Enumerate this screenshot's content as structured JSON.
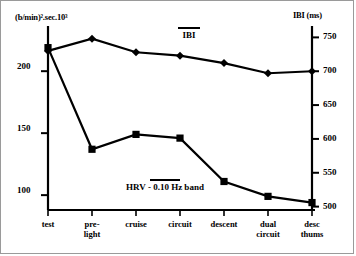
{
  "chart_data": {
    "type": "line",
    "title": "",
    "xlabel": "",
    "categories": [
      "test",
      "pre-light",
      "cruise",
      "circuit",
      "descent",
      "dual circuit",
      "desc thums"
    ],
    "category_lines": [
      [
        "test",
        ""
      ],
      [
        "pre-",
        "light"
      ],
      [
        "cruise",
        ""
      ],
      [
        "circuit",
        ""
      ],
      [
        "descent",
        ""
      ],
      [
        "dual",
        "circuit"
      ],
      [
        "desc",
        "thums"
      ]
    ],
    "grid": false,
    "legend_position": "inline-annotations",
    "axes": {
      "left": {
        "label": "(b/min)².sec.10³",
        "ticks": [
          200,
          150,
          100
        ],
        "tick_labels": [
          "200",
          "150",
          "100"
        ],
        "min": 88,
        "max": 230
      },
      "right": {
        "label": "IBI (ms)",
        "ticks": [
          750,
          700,
          650,
          600,
          550,
          500
        ],
        "tick_labels": [
          "750",
          "700",
          "650",
          "600",
          "550",
          "500"
        ],
        "min": 495,
        "max": 755
      }
    },
    "series": [
      {
        "name": "IBI",
        "annotation": "IBI",
        "axis": "right",
        "marker": "diamond",
        "unit": "ms",
        "values": [
          730,
          748,
          728,
          723,
          712,
          697,
          700
        ]
      },
      {
        "name": "HRV - 0.10 Hz band",
        "annotation": "HRV - 0.10 Hz band",
        "axis": "left",
        "marker": "square",
        "unit": "(b/min)².sec.10³",
        "values": [
          219,
          137,
          149,
          146,
          111,
          99,
          94
        ]
      }
    ]
  }
}
